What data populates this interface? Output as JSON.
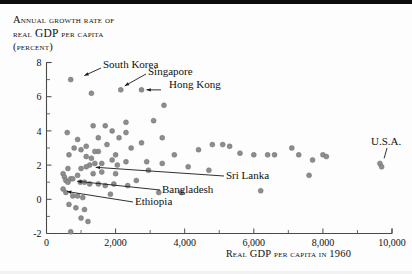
{
  "figure": {
    "title_lines": [
      "Annual growth rate of",
      "real GDP per capita",
      "(percent)"
    ],
    "title_line2_prefix": "real ",
    "title_line2_gdp": "GDP",
    "title_line2_suffix": " per capita",
    "x_axis_caption_prefix": "Real ",
    "x_axis_caption_gdp": "GDP",
    "x_axis_caption_mid": " per capita in ",
    "x_axis_caption_year": "1960"
  },
  "chart_data": {
    "type": "scatter",
    "title": "Annual growth rate of real GDP per capita (percent)",
    "xlabel": "Real GDP per capita in 1960",
    "ylabel": "Annual growth rate of real GDP per capita (percent)",
    "xlim": [
      0,
      10000
    ],
    "ylim": [
      -2,
      8
    ],
    "xticks": [
      0,
      2000,
      4000,
      6000,
      8000,
      10000
    ],
    "xticklabels": [
      "0",
      "2,000",
      "4,000",
      "6,000",
      "8,000",
      "10,000"
    ],
    "yticks": [
      -2,
      0,
      2,
      4,
      6,
      8
    ],
    "yticklabels": [
      "-2",
      "0",
      "2",
      "4",
      "6",
      "8"
    ],
    "x_minor_ticks": [
      1000,
      3000,
      5000,
      7000,
      9000
    ],
    "y_minor_ticks": [
      -1,
      1,
      3,
      5,
      7
    ],
    "grid": false,
    "legend": null,
    "marker_color": "#8d8d8d",
    "annotations": [
      {
        "label": "South Korea",
        "x": 980,
        "y": 7.0
      },
      {
        "label": "Singapore",
        "x": 2150,
        "y": 6.4
      },
      {
        "label": "Hong Kong",
        "x": 2750,
        "y": 6.4
      },
      {
        "label": "Sri Lanka",
        "x": 1280,
        "y": 1.9
      },
      {
        "label": "Bangladesh",
        "x": 760,
        "y": 1.2
      },
      {
        "label": "Ethiopia",
        "x": 480,
        "y": 0.6
      },
      {
        "label": "U.S.A.",
        "x": 9700,
        "y": 2.1
      }
    ],
    "points": [
      [
        700,
        7.0
      ],
      [
        1300,
        6.2
      ],
      [
        2150,
        6.4
      ],
      [
        2750,
        6.4
      ],
      [
        3400,
        5.5
      ],
      [
        3100,
        4.6
      ],
      [
        1350,
        4.3
      ],
      [
        1700,
        4.3
      ],
      [
        2300,
        4.5
      ],
      [
        2300,
        3.9
      ],
      [
        2100,
        3.6
      ],
      [
        600,
        3.9
      ],
      [
        900,
        3.5
      ],
      [
        1500,
        3.6
      ],
      [
        2750,
        3.3
      ],
      [
        3350,
        3.6
      ],
      [
        1150,
        3.1
      ],
      [
        1750,
        3.2
      ],
      [
        2450,
        3.0
      ],
      [
        800,
        3.0
      ],
      [
        1000,
        2.9
      ],
      [
        1500,
        2.8
      ],
      [
        2000,
        2.6
      ],
      [
        650,
        2.6
      ],
      [
        1150,
        2.5
      ],
      [
        1300,
        2.4
      ],
      [
        1900,
        2.3
      ],
      [
        2300,
        2.2
      ],
      [
        2900,
        2.2
      ],
      [
        3700,
        2.6
      ],
      [
        4400,
        2.9
      ],
      [
        4800,
        3.2
      ],
      [
        5100,
        3.2
      ],
      [
        5300,
        3.1
      ],
      [
        5600,
        2.7
      ],
      [
        6000,
        2.6
      ],
      [
        6400,
        2.6
      ],
      [
        6600,
        2.6
      ],
      [
        7100,
        3.0
      ],
      [
        7300,
        2.6
      ],
      [
        7700,
        2.3
      ],
      [
        8000,
        2.6
      ],
      [
        8100,
        2.5
      ],
      [
        9650,
        2.1
      ],
      [
        9700,
        1.9
      ],
      [
        4100,
        1.9
      ],
      [
        4700,
        1.7
      ],
      [
        7600,
        1.4
      ],
      [
        6200,
        0.5
      ],
      [
        3900,
        0.4
      ],
      [
        3350,
        2.1
      ],
      [
        2950,
        1.7
      ],
      [
        1250,
        2.0
      ],
      [
        1400,
        2.1
      ],
      [
        1150,
        1.9
      ],
      [
        1000,
        1.8
      ],
      [
        620,
        1.8
      ],
      [
        480,
        1.5
      ],
      [
        520,
        1.3
      ],
      [
        560,
        1.1
      ],
      [
        620,
        1.0
      ],
      [
        700,
        1.2
      ],
      [
        760,
        1.2
      ],
      [
        900,
        1.4
      ],
      [
        980,
        1.0
      ],
      [
        1100,
        1.0
      ],
      [
        1250,
        0.9
      ],
      [
        1500,
        0.9
      ],
      [
        1700,
        0.8
      ],
      [
        1950,
        0.9
      ],
      [
        2350,
        0.8
      ],
      [
        3250,
        0.4
      ],
      [
        480,
        0.6
      ],
      [
        560,
        0.4
      ],
      [
        760,
        0.2
      ],
      [
        900,
        0.2
      ],
      [
        1050,
        0.1
      ],
      [
        650,
        -0.3
      ],
      [
        850,
        -0.5
      ],
      [
        1100,
        -0.6
      ],
      [
        1000,
        -1.1
      ],
      [
        1200,
        -1.3
      ],
      [
        700,
        -1.9
      ],
      [
        1350,
        1.5
      ],
      [
        1600,
        1.6
      ],
      [
        2000,
        1.5
      ],
      [
        2600,
        1.1
      ],
      [
        1850,
        0.3
      ],
      [
        1400,
        2.8
      ],
      [
        1600,
        2.1
      ],
      [
        1900,
        4.0
      ],
      [
        2050,
        2.0
      ]
    ]
  }
}
